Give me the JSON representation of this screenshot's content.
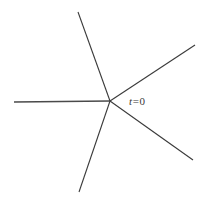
{
  "figure": {
    "background_color": "#ffffff",
    "stroke_color": "#3a3a3a",
    "width": 203,
    "height": 204,
    "vertex": {
      "x": 110,
      "y": 101,
      "label": "t = 0"
    },
    "label": {
      "variable": "t",
      "relation": "=",
      "value": "0",
      "x": 129,
      "y": 95
    },
    "rays": [
      {
        "name": "ray-left",
        "label": "left horizontal ray",
        "angle_deg": 180,
        "x1": 110,
        "y1": 101,
        "x2": 14,
        "y2": 102,
        "stroke_width": 1.5
      },
      {
        "name": "ray-upper",
        "label": "upper steep ray",
        "angle_deg": 108,
        "x1": 110,
        "y1": 101,
        "x2": 78,
        "y2": 12,
        "stroke_width": 1.1
      },
      {
        "name": "ray-upper-right",
        "label": "upper right ray",
        "angle_deg": 27,
        "x1": 110,
        "y1": 101,
        "x2": 195,
        "y2": 45,
        "stroke_width": 1.1
      },
      {
        "name": "ray-lower-right",
        "label": "lower right ray",
        "angle_deg": -35,
        "x1": 110,
        "y1": 101,
        "x2": 193,
        "y2": 160,
        "stroke_width": 1.1
      },
      {
        "name": "ray-lower-left",
        "label": "lower steep ray",
        "angle_deg": -72,
        "x1": 110,
        "y1": 101,
        "x2": 79,
        "y2": 192,
        "stroke_width": 1.1
      }
    ]
  }
}
